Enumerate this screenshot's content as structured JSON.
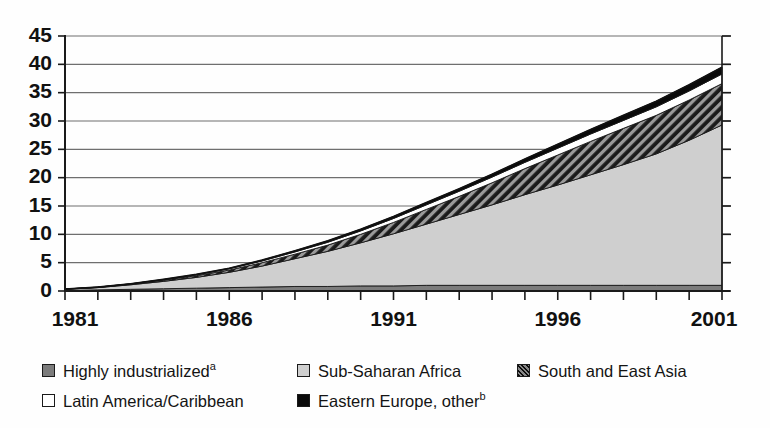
{
  "chart_data": {
    "type": "area",
    "stacked": true,
    "title": "",
    "xlabel": "",
    "ylabel": "",
    "xlim": [
      1981,
      2001
    ],
    "ylim": [
      0,
      45
    ],
    "ytick_step": 5,
    "grid": true,
    "legend_position": "bottom",
    "x": [
      1981,
      1982,
      1983,
      1984,
      1985,
      1986,
      1987,
      1988,
      1989,
      1990,
      1991,
      1992,
      1993,
      1994,
      1995,
      1996,
      1997,
      1998,
      1999,
      2000,
      2001
    ],
    "xtick_labels": [
      "1981",
      "1986",
      "1991",
      "1996",
      "2001"
    ],
    "xtick_years": [
      1981,
      1986,
      1991,
      1996,
      2001
    ],
    "ytick_labels": [
      "0",
      "5",
      "10",
      "15",
      "20",
      "25",
      "30",
      "35",
      "40",
      "45"
    ],
    "series": [
      {
        "name": "Highly industrialized",
        "footnote": "a",
        "swatch": "darkgray",
        "color": "#7c7c7c",
        "values": [
          0.1,
          0.2,
          0.3,
          0.4,
          0.5,
          0.6,
          0.7,
          0.8,
          0.8,
          0.9,
          0.9,
          1.0,
          1.0,
          1.0,
          1.0,
          1.0,
          1.0,
          1.0,
          1.0,
          1.0,
          1.0
        ]
      },
      {
        "name": "Sub-Saharan Africa",
        "footnote": "",
        "swatch": "lightgray",
        "color": "#cfcfcf",
        "values": [
          0.2,
          0.4,
          0.8,
          1.3,
          1.9,
          2.7,
          3.7,
          4.9,
          6.2,
          7.6,
          9.2,
          10.8,
          12.5,
          14.2,
          16.0,
          17.7,
          19.5,
          21.3,
          23.2,
          25.6,
          28.3
        ]
      },
      {
        "name": "South and East Asia",
        "footnote": "",
        "swatch": "hatch",
        "color": "#2a2a2a",
        "values": [
          0.03,
          0.05,
          0.1,
          0.2,
          0.3,
          0.4,
          0.6,
          0.8,
          1.1,
          1.5,
          2.0,
          2.6,
          3.2,
          3.9,
          4.6,
          5.3,
          5.9,
          6.4,
          6.8,
          7.1,
          7.3
        ]
      },
      {
        "name": "Latin America/Caribbean",
        "footnote": "",
        "swatch": "white",
        "color": "#ffffff",
        "values": [
          0.01,
          0.02,
          0.05,
          0.1,
          0.15,
          0.22,
          0.3,
          0.4,
          0.5,
          0.6,
          0.7,
          0.8,
          0.9,
          1.0,
          1.1,
          1.2,
          1.3,
          1.4,
          1.5,
          1.6,
          1.7
        ]
      },
      {
        "name": "Eastern Europe, other",
        "footnote": "b",
        "swatch": "black",
        "color": "#0a0a0a",
        "values": [
          0.01,
          0.02,
          0.03,
          0.05,
          0.08,
          0.1,
          0.15,
          0.2,
          0.25,
          0.3,
          0.35,
          0.4,
          0.45,
          0.5,
          0.6,
          0.7,
          0.8,
          0.9,
          1.0,
          1.1,
          1.2
        ]
      }
    ],
    "totals": [
      0.35,
      0.69,
      1.28,
      2.05,
      2.93,
      4.02,
      5.45,
      7.1,
      8.85,
      10.9,
      13.15,
      15.6,
      18.05,
      20.6,
      23.3,
      25.9,
      28.5,
      31.0,
      33.5,
      36.4,
      39.5
    ]
  },
  "legend": {
    "items": [
      {
        "label": "Highly industrialized",
        "footnote": "a",
        "swatch": "darkgray"
      },
      {
        "label": "Sub-Saharan Africa",
        "footnote": "",
        "swatch": "lightgray"
      },
      {
        "label": "South and East Asia",
        "footnote": "",
        "swatch": "hatch"
      },
      {
        "label": "Latin America/Caribbean",
        "footnote": "",
        "swatch": "white"
      },
      {
        "label": "Eastern Europe, other",
        "footnote": "b",
        "swatch": "black"
      }
    ]
  }
}
